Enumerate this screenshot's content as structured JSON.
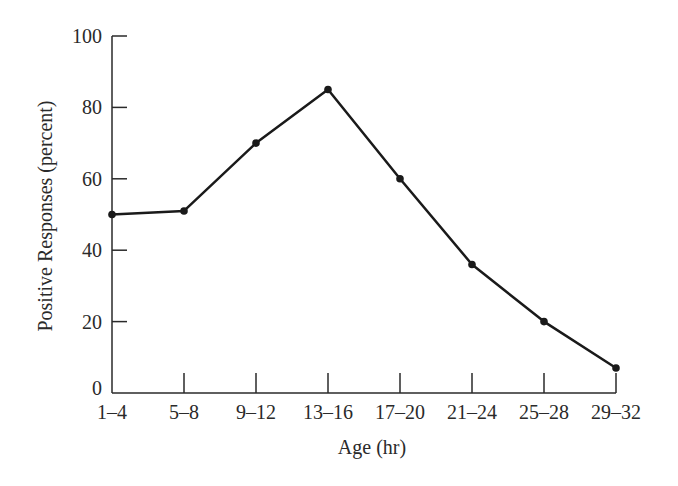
{
  "chart_data": {
    "type": "line",
    "title": "",
    "xlabel": "Age (hr)",
    "ylabel": "Positive Responses (percent)",
    "categories": [
      "1–4",
      "5–8",
      "9–12",
      "13–16",
      "17–20",
      "21–24",
      "25–28",
      "29–32"
    ],
    "series": [
      {
        "name": "Positive Responses",
        "values": [
          50,
          51,
          70,
          85,
          60,
          36,
          20,
          7
        ]
      }
    ],
    "ylim": [
      0,
      100
    ],
    "yticks": [
      "0",
      "20",
      "40",
      "60",
      "80",
      "100"
    ],
    "grid": false,
    "legend": null,
    "colors": {
      "line": "#1a1a1a",
      "axis": "#2a2a2a"
    }
  }
}
